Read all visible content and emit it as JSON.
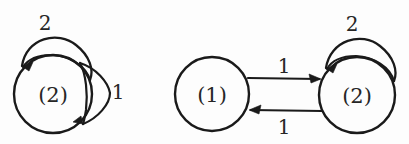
{
  "figure": {
    "title": "",
    "background_color": "#fdfdfd",
    "ink_color": "#1a1a1a",
    "text_color": "#262626",
    "diagrams": [
      {
        "id": "left-diagram",
        "name": "single-state-automaton",
        "nodes": [
          {
            "id": "left-node-2",
            "label": "(2)",
            "cx": 53,
            "cy": 94,
            "r": 39
          }
        ],
        "edges": [
          {
            "id": "left-loop-top",
            "name": "self-loop-top",
            "label": "2",
            "label_x": 45,
            "label_y": 30,
            "from": "left-node-2",
            "to": "left-node-2",
            "kind": "self-loop",
            "position": "top",
            "arrow_direction": "counter-clockwise"
          },
          {
            "id": "left-loop-right",
            "name": "self-loop-right",
            "label": "1",
            "label_x": 113,
            "label_y": 99,
            "from": "left-node-2",
            "to": "left-node-2",
            "kind": "self-loop",
            "position": "right",
            "arrow_direction": "clockwise"
          }
        ]
      },
      {
        "id": "right-diagram",
        "name": "two-state-automaton",
        "nodes": [
          {
            "id": "right-node-1",
            "label": "(1)",
            "cx": 212,
            "cy": 94,
            "r": 37
          },
          {
            "id": "right-node-2",
            "label": "(2)",
            "cx": 357,
            "cy": 95,
            "r": 38
          }
        ],
        "edges": [
          {
            "id": "edge-1-to-2",
            "name": "transition-one-to-two",
            "label": "1",
            "label_x": 279,
            "label_y": 73,
            "from": "right-node-1",
            "to": "right-node-2",
            "kind": "straight",
            "position": "top",
            "arrow_direction": "right"
          },
          {
            "id": "edge-2-to-1",
            "name": "transition-two-to-one",
            "label": "1",
            "label_x": 279,
            "label_y": 134,
            "from": "right-node-2",
            "to": "right-node-1",
            "kind": "straight",
            "position": "bottom",
            "arrow_direction": "left"
          },
          {
            "id": "right-loop-top",
            "name": "self-loop-top",
            "label": "2",
            "label_x": 347,
            "label_y": 31,
            "from": "right-node-2",
            "to": "right-node-2",
            "kind": "self-loop",
            "position": "top",
            "arrow_direction": "counter-clockwise"
          }
        ]
      }
    ]
  }
}
